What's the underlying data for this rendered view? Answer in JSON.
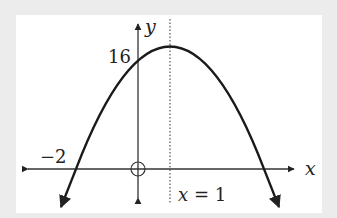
{
  "figure": {
    "x_axis_label": "x",
    "y_axis_label": "y",
    "y_intercept_label": "16",
    "x_intercept_label": "−2",
    "axis_of_symmetry_label": "x = 1",
    "axis_of_symmetry_var": "x",
    "axis_of_symmetry_eq": "= 1",
    "colors": {
      "curve": "#1a1a1a",
      "axes": "#333333",
      "background": "#ffffff",
      "page": "#ececec"
    }
  },
  "graph_data": {
    "type": "parabola",
    "equation": "y = -2(x + 2)(x - 4)",
    "opens": "down",
    "vertex": [
      1,
      18
    ],
    "y_intercept": 16,
    "x_intercepts": [
      -2,
      4
    ],
    "axis_of_symmetry": "x = 1",
    "labeled_points": [
      {
        "label": "16",
        "x": 0,
        "y": 16
      },
      {
        "label": "-2",
        "x": -2,
        "y": 0
      }
    ]
  }
}
